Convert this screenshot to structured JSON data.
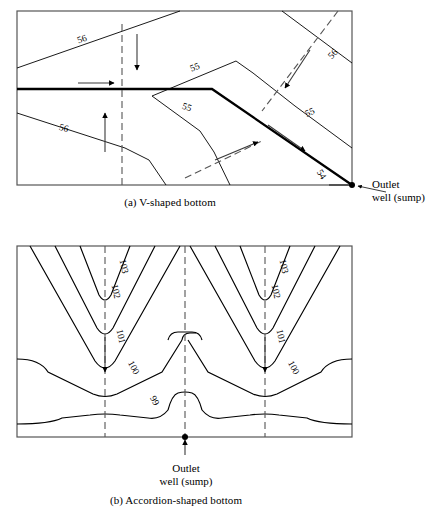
{
  "figure": {
    "panels": [
      {
        "id": "panel-a",
        "caption": "(a) V-shaped bottom",
        "frame": {
          "x": 17,
          "y": 11,
          "width": 335,
          "height": 174
        },
        "annotation": {
          "line1": "Outlet",
          "line2": "well (sump)"
        },
        "contour_labels": [
          {
            "text": "56",
            "x": 83,
            "y": 42,
            "rotate": -20
          },
          {
            "text": "56",
            "x": 335,
            "y": 56,
            "rotate": -46
          },
          {
            "text": "55",
            "x": 196,
            "y": 70,
            "rotate": -22
          },
          {
            "text": "55",
            "x": 186,
            "y": 110,
            "rotate": 18
          },
          {
            "text": "55",
            "x": 311,
            "y": 115,
            "rotate": -24
          },
          {
            "text": "56",
            "x": 63,
            "y": 131,
            "rotate": 14
          },
          {
            "text": "54",
            "x": 319,
            "y": 176,
            "rotate": 58
          }
        ]
      },
      {
        "id": "panel-b",
        "caption": "(b) Accordion-shaped bottom",
        "frame": {
          "x": 17,
          "y": 246,
          "width": 335,
          "height": 191
        },
        "annotation": {
          "line1": "Outlet",
          "line2": "well (sump)"
        },
        "contour_labels": [
          {
            "text": "103",
            "x": 121,
            "y": 267,
            "rotate": 78
          },
          {
            "text": "102",
            "x": 113,
            "y": 292,
            "rotate": 78
          },
          {
            "text": "101",
            "x": 118,
            "y": 337,
            "rotate": 78
          },
          {
            "text": "100",
            "x": 131,
            "y": 369,
            "rotate": 62
          },
          {
            "text": "99",
            "x": 152,
            "y": 402,
            "rotate": 62
          },
          {
            "text": "103",
            "x": 281,
            "y": 267,
            "rotate": 78
          },
          {
            "text": "102",
            "x": 273,
            "y": 292,
            "rotate": 78
          },
          {
            "text": "101",
            "x": 278,
            "y": 337,
            "rotate": 78
          },
          {
            "text": "100",
            "x": 291,
            "y": 369,
            "rotate": 62
          }
        ]
      }
    ],
    "colors": {
      "stroke": "#000000",
      "frame": "#555555",
      "background": "#ffffff"
    }
  }
}
